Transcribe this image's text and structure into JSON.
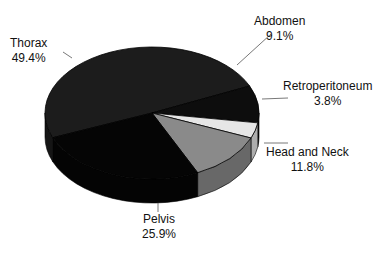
{
  "chart_data": {
    "type": "pie",
    "style": "3d",
    "title": "",
    "categories": [
      "Thorax",
      "Abdomen",
      "Retroperitoneum",
      "Head and Neck",
      "Pelvis"
    ],
    "values": [
      49.4,
      9.1,
      3.8,
      11.8,
      25.9
    ],
    "unit": "%",
    "colors": [
      "#1c1c1c",
      "#0d0d0d",
      "#e6e6e6",
      "#8a8a8a",
      "#050505"
    ],
    "legend": "none",
    "labels": [
      {
        "name": "Thorax",
        "value": "49.4%"
      },
      {
        "name": "Abdomen",
        "value": "9.1%"
      },
      {
        "name": "Retroperitoneum",
        "value": "3.8%"
      },
      {
        "name": "Head and Neck",
        "value": "11.8%"
      },
      {
        "name": "Pelvis",
        "value": "25.9%"
      }
    ]
  }
}
